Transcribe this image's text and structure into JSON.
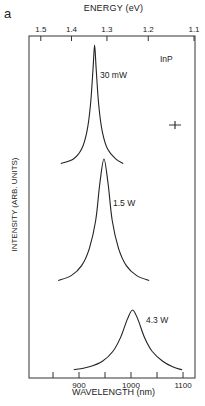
{
  "panel_label": "a",
  "chart_data": {
    "type": "line",
    "title": "",
    "xlabel": "WAVELENGTH (nm)",
    "ylabel": "INTENSITY (ARB. UNITS)",
    "top_axis_label": "ENERGY (eV)",
    "sample_label": "InP",
    "xlim": [
      820,
      1120
    ],
    "x_ticks": [
      900,
      1000,
      1100
    ],
    "x_tick_labels": [
      "900",
      "1000",
      "1100"
    ],
    "x_minor_ticks": [
      850,
      950,
      1050
    ],
    "top_ticks": [
      1.5,
      1.4,
      1.3,
      1.2,
      1.1
    ],
    "top_tick_labels": [
      "1.5",
      "1.4",
      "1.3",
      "1.2",
      "1.1"
    ],
    "grid": false,
    "legend": "none (inline labels)",
    "series": [
      {
        "name": "30 mW",
        "label": "30 mW",
        "peak_wavelength_nm": 930,
        "fwhm_nm": 12,
        "x": [
          865,
          890,
          905,
          915,
          922,
          927,
          930,
          933,
          938,
          945,
          955,
          970,
          985
        ],
        "values": [
          0.02,
          0.06,
          0.14,
          0.28,
          0.5,
          0.8,
          1.0,
          0.8,
          0.5,
          0.28,
          0.14,
          0.06,
          0.02
        ]
      },
      {
        "name": "1.5 W",
        "label": "1.5 W",
        "peak_wavelength_nm": 948,
        "fwhm_nm": 22,
        "x": [
          860,
          885,
          905,
          920,
          932,
          940,
          948,
          956,
          964,
          976,
          991,
          1011,
          1035
        ],
        "values": [
          0.02,
          0.06,
          0.14,
          0.28,
          0.5,
          0.8,
          1.0,
          0.8,
          0.5,
          0.28,
          0.14,
          0.06,
          0.02
        ]
      },
      {
        "name": "4.3 W",
        "label": "4.3 W",
        "peak_wavelength_nm": 1003,
        "fwhm_nm": 55,
        "x": [
          890,
          920,
          945,
          965,
          980,
          993,
          1003,
          1013,
          1026,
          1041,
          1061,
          1080,
          1098
        ],
        "values": [
          0.02,
          0.07,
          0.16,
          0.32,
          0.55,
          0.85,
          1.0,
          0.85,
          0.55,
          0.32,
          0.16,
          0.07,
          0.02
        ]
      }
    ],
    "annotations": [
      "30 mW",
      "1.5 W",
      "4.3 W",
      "InP",
      "resolution bar (+)"
    ]
  },
  "axes": {
    "top_title": "ENERGY (eV)",
    "bottom_title": "WAVELENGTH (nm)",
    "left_title": "INTENSITY (ARB. UNITS)"
  }
}
